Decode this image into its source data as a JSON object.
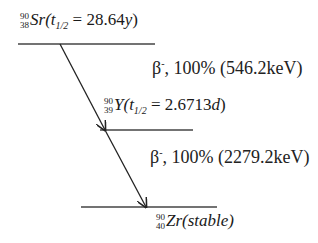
{
  "diagram": {
    "type": "nuclear-decay-scheme",
    "levels": [
      {
        "id": "sr90",
        "mass": "90",
        "atomic": "38",
        "symbol": "Sr",
        "halflife_prefix": "(t",
        "halflife_sub": "1/2",
        "halflife_value": " = 28.64",
        "halflife_unit": "y",
        "close": ")"
      },
      {
        "id": "y90",
        "mass": "90",
        "atomic": "39",
        "symbol": "Y",
        "halflife_prefix": "(t",
        "halflife_sub": "1/2",
        "halflife_value": " = 2.6713",
        "halflife_unit": "d",
        "close": ")"
      },
      {
        "id": "zr90",
        "mass": "90",
        "atomic": "40",
        "symbol": "Zr",
        "state": "(stable)"
      }
    ],
    "transitions": [
      {
        "from": "sr90",
        "to": "y90",
        "particle": "β",
        "charge": "-",
        "text": ", 100% (546.2keV)"
      },
      {
        "from": "y90",
        "to": "zr90",
        "particle": "β",
        "charge": "-",
        "text": ", 100% (2279.2keV)"
      }
    ],
    "colors": {
      "line": "#333333",
      "text": "#1a1a1a"
    }
  }
}
